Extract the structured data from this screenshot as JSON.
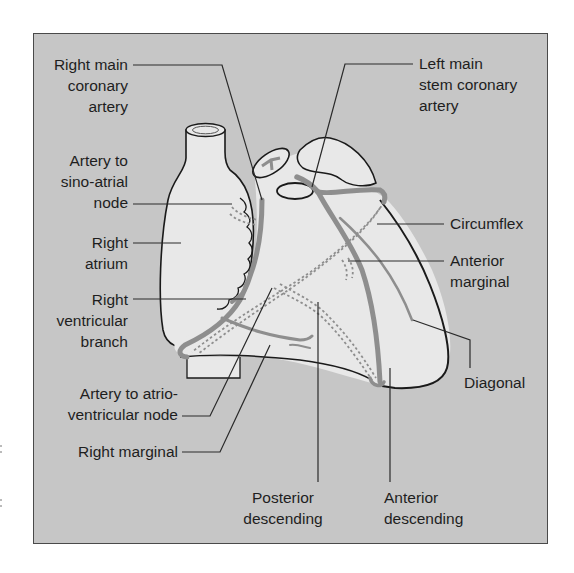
{
  "figure": {
    "colors": {
      "background": "#ffffff",
      "frame_fill": "#c6c6c6",
      "frame_border": "#4a4a4a",
      "heart_fill": "#e8e8e8",
      "vessel": "#8e8e8e",
      "outline": "#1a1a1a",
      "leader_line": "#2a2a2a",
      "label_text": "#1e1e1e"
    }
  },
  "labels": {
    "right_main_coronary": "Right main\ncoronary\nartery",
    "sino_atrial": "Artery to\nsino-atrial\nnode",
    "right_atrium": "Right\natrium",
    "right_ventricular_branch": "Right\nventricular\nbranch",
    "atrio_ventricular": "Artery to atrio-\nventricular node",
    "right_marginal": "Right marginal",
    "posterior_descending": "Posterior\ndescending",
    "anterior_descending": "Anterior\ndescending",
    "diagonal": "Diagonal",
    "anterior_marginal": "Anterior\nmarginal",
    "circumflex": "Circumflex",
    "left_main_stem": "Left main\nstem coronary\nartery"
  }
}
